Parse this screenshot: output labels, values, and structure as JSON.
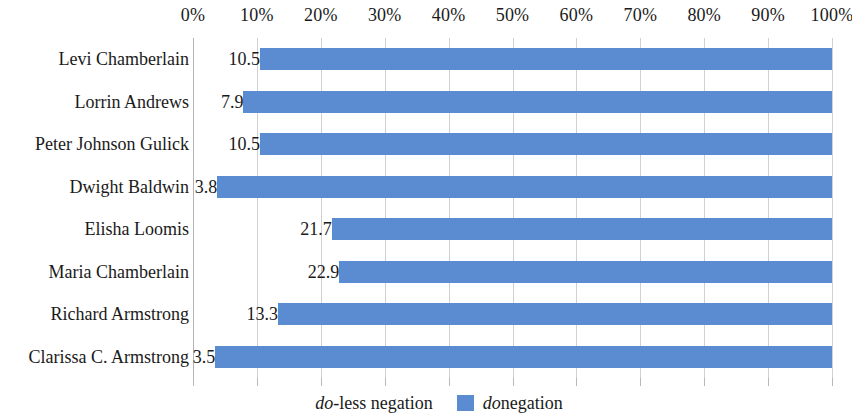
{
  "chart_data": {
    "type": "bar",
    "orientation": "horizontal",
    "stacked": true,
    "title": "",
    "xlabel": "",
    "ylabel": "",
    "xlim": [
      0,
      100
    ],
    "xtick_labels": [
      "0%",
      "10%",
      "20%",
      "30%",
      "40%",
      "50%",
      "60%",
      "70%",
      "80%",
      "90%",
      "100%"
    ],
    "xtick_values": [
      0,
      10,
      20,
      30,
      40,
      50,
      60,
      70,
      80,
      90,
      100
    ],
    "grid": true,
    "grid_axis": "x",
    "legend_position": "bottom",
    "categories": [
      "Levi Chamberlain",
      "Lorrin Andrews",
      "Peter Johnson Gulick",
      "Dwight Baldwin",
      "Elisha Loomis",
      "Maria Chamberlain",
      "Richard Armstrong",
      "Clarissa C. Armstrong"
    ],
    "series": [
      {
        "name": "do-less negation",
        "name_italic_prefix": "do",
        "name_rest": "-less negation",
        "color": "#ffffff",
        "values": [
          10.5,
          7.9,
          10.5,
          3.8,
          21.7,
          22.9,
          13.3,
          3.5
        ],
        "value_labels": [
          "10.5",
          "7.9",
          "10.5",
          "3.8",
          "21.7",
          "22.9",
          "13.3",
          "3.5"
        ]
      },
      {
        "name": "do negation",
        "name_italic_prefix": "do",
        "name_rest": " negation",
        "color": "#5B8BD0",
        "values": [
          89.5,
          92.1,
          89.5,
          96.2,
          78.3,
          77.1,
          86.7,
          96.5
        ],
        "value_labels": [
          "",
          "",
          "",
          "",
          "",
          "",
          "",
          ""
        ]
      }
    ]
  },
  "legend": {
    "items": [
      {
        "italic": "do",
        "rest": "-less negation",
        "swatch": "blank",
        "color": "#ffffff"
      },
      {
        "italic": "do",
        "rest": " negation",
        "swatch": "blue",
        "color": "#5B8BD0"
      }
    ]
  },
  "colors": {
    "bar_blue": "#5B8BD0",
    "gridline": "#d0d0d0",
    "axis": "#b4b4b4",
    "text": "#1a1a1a",
    "background": "#ffffff"
  }
}
